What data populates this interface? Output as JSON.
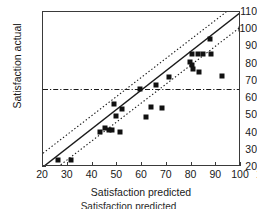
{
  "chart_data": {
    "type": "scatter",
    "title": "",
    "xlabel": "Satisfaction predicted",
    "ylabel": "Satisfaction actual",
    "xlim": [
      20,
      100
    ],
    "ylim": [
      20,
      110
    ],
    "xticks": [
      20,
      30,
      40,
      50,
      60,
      70,
      80,
      90,
      100
    ],
    "yticks": [
      20,
      30,
      40,
      50,
      60,
      70,
      80,
      90,
      100,
      110
    ],
    "xtick_labels": [
      "20",
      "30",
      "40",
      "50",
      "60",
      "70",
      "80",
      "90",
      "100",
      "100"
    ],
    "ytick_labels": [
      "20",
      "30",
      "40",
      "50",
      "60",
      "70",
      "80",
      "90",
      "100",
      "110"
    ],
    "grid": false,
    "legend": "none",
    "marker_style": "filled-square",
    "marker_color": "#111111",
    "points": [
      {
        "x": 26.0,
        "y": 24.0
      },
      {
        "x": 31.5,
        "y": 24.0
      },
      {
        "x": 43.0,
        "y": 40.5
      },
      {
        "x": 45.0,
        "y": 42.5
      },
      {
        "x": 46.5,
        "y": 41.5
      },
      {
        "x": 48.0,
        "y": 41.5
      },
      {
        "x": 48.5,
        "y": 56.5
      },
      {
        "x": 49.5,
        "y": 49.5
      },
      {
        "x": 51.0,
        "y": 40.5
      },
      {
        "x": 52.0,
        "y": 53.5
      },
      {
        "x": 59.0,
        "y": 65.5
      },
      {
        "x": 61.5,
        "y": 49.0
      },
      {
        "x": 63.5,
        "y": 55.0
      },
      {
        "x": 65.5,
        "y": 67.5
      },
      {
        "x": 68.0,
        "y": 54.0
      },
      {
        "x": 71.0,
        "y": 72.5
      },
      {
        "x": 79.5,
        "y": 81.0
      },
      {
        "x": 80.0,
        "y": 85.5
      },
      {
        "x": 80.0,
        "y": 79.0
      },
      {
        "x": 80.5,
        "y": 77.0
      },
      {
        "x": 82.5,
        "y": 85.5
      },
      {
        "x": 83.0,
        "y": 75.0
      },
      {
        "x": 84.5,
        "y": 85.5
      },
      {
        "x": 87.5,
        "y": 94.5
      },
      {
        "x": 88.0,
        "y": 85.5
      },
      {
        "x": 92.5,
        "y": 73.0
      },
      {
        "x": 100.0,
        "y": 100.0
      }
    ],
    "lines": [
      {
        "name": "regression-line",
        "style": "solid",
        "color": "#1a1a1a",
        "from": {
          "x": 20.0,
          "y": 20.0
        },
        "to": {
          "x": 100.0,
          "y": 110.0
        }
      },
      {
        "name": "upper-confidence-band",
        "style": "dotted",
        "color": "#1a1a1a",
        "from": {
          "x": 20.0,
          "y": 28.0
        },
        "to": {
          "x": 94.0,
          "y": 110.0
        }
      },
      {
        "name": "lower-confidence-band",
        "style": "dotted",
        "color": "#1a1a1a",
        "from": {
          "x": 26.0,
          "y": 20.0
        },
        "to": {
          "x": 100.0,
          "y": 101.5
        }
      },
      {
        "name": "reference-threshold-line",
        "style": "dash-dot",
        "color": "#1a1a1a",
        "orientation": "horizontal",
        "y": 65.0
      }
    ],
    "annotations": []
  },
  "caption": {
    "text": "Satisfaction predicted"
  }
}
